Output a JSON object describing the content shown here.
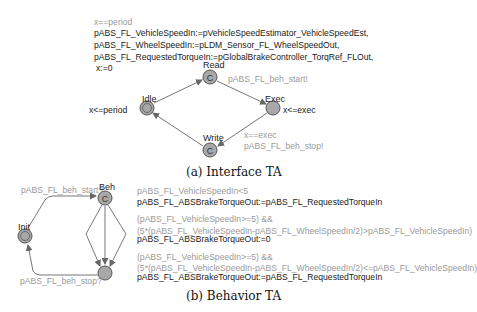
{
  "interface_ta": {
    "caption": "(a) Interface TA",
    "top_update": {
      "guard": "x==period",
      "lines": [
        "pABS_FL_VehicleSpeedIn:=pVehicleSpeedEstimator_VehicleSpeedEst,",
        "pABS_FL_WheelSpeedIn:=pLDM_Sensor_FL_WheelSpeedOut,",
        "pABS_FL_RequestedTorqueIn:=pGlobalBrakeController_TorqRef_FLOut,",
        "x:=0"
      ]
    },
    "nodes": {
      "idle": {
        "label": "Idle",
        "invariant": "x<=period",
        "type": "initial"
      },
      "read": {
        "label": "Read",
        "glyph": "C",
        "type": "committed"
      },
      "exec": {
        "label": "Exec",
        "invariant": "x<=exec",
        "type": "normal"
      },
      "write": {
        "label": "Write",
        "glyph": "C",
        "type": "committed"
      }
    },
    "edges": {
      "read_exec_sync": "pABS_FL_beh_start!",
      "exec_write_guard": "x==exec",
      "exec_write_sync": "pABS_FL_beh_stop!"
    }
  },
  "behavior_ta": {
    "caption": "(b) Behavior TA",
    "nodes": {
      "init": {
        "label": "Init",
        "type": "initial"
      },
      "beh": {
        "label": "Beh",
        "glyph": "C",
        "type": "committed"
      },
      "end": {
        "label": "",
        "type": "normal"
      }
    },
    "edges": {
      "init_beh_sync": "pABS_FL_beh_start?",
      "end_init_sync": "pABS_FL_beh_stop?"
    },
    "branches": [
      {
        "guard_lines": [
          "pABS_FL_VehicleSpeedIn<5"
        ],
        "update": "pABS_FL_ABSBrakeTorqueOut:=pABS_FL_RequestedTorqueIn"
      },
      {
        "guard_lines": [
          "(pABS_FL_VehicleSpeedIn>=5) &&",
          "(5*(pABS_FL_VehicleSpeedIn-pABS_FL_WheelSpeedIn/2)>pABS_FL_VehicleSpeedIn)"
        ],
        "update": "pABS_FL_ABSBrakeTorqueOut:=0"
      },
      {
        "guard_lines": [
          "(pABS_FL_VehicleSpeedIn>=5) &&",
          "(5*(pABS_FL_VehicleSpeedIn-pABS_FL_WheelSpeedIn/2)<=pABS_FL_VehicleSpeedIn)"
        ],
        "update": "pABS_FL_ABSBrakeTorqueOut:=pABS_FL_RequestedTorqueIn"
      }
    ]
  },
  "colors": {
    "node_fill": "#a8a8a8",
    "node_stroke": "#555555",
    "edge": "#666666",
    "guard_text": "#9a9a9a",
    "update_text": "#1a1a1a"
  }
}
